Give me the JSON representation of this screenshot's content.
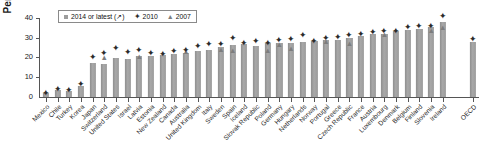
{
  "chart_data": {
    "type": "bar",
    "title": "",
    "xlabel": "",
    "ylabel": "Per cent",
    "ylim": [
      0,
      45
    ],
    "yticks": [
      0,
      10,
      20,
      30,
      40
    ],
    "grid": false,
    "legend_position": "top-left",
    "categories": [
      "Mexico",
      "Chile",
      "Turkey",
      "Korea",
      "Japan",
      "Switzerland",
      "United States",
      "Israel",
      "Latvia",
      "Estonia",
      "New Zealand",
      "Canada",
      "Australia",
      "United Kingdom",
      "Italy",
      "Sweden",
      "Spain",
      "Iceland",
      "Slovak Republic",
      "Poland",
      "Germany",
      "Hungary",
      "Netherlands",
      "Norway",
      "Portugal",
      "Greece",
      "Czech Republic",
      "France",
      "Austria",
      "Luxembourg",
      "Denmark",
      "Belgium",
      "Finland",
      "Slovenia",
      "Ireland",
      "OECD"
    ],
    "series": [
      {
        "name": "2014 or latest (↗)",
        "marker": "bar",
        "color": "#9d9d9d",
        "values": [
          2.0,
          3.5,
          3.2,
          5.5,
          17.0,
          16.5,
          19.5,
          19.0,
          20.5,
          20.5,
          21.0,
          22.0,
          22.5,
          23.5,
          24.0,
          25.5,
          26.5,
          27.0,
          26.0,
          27.5,
          27.5,
          27.5,
          28.0,
          28.5,
          29.0,
          29.0,
          30.0,
          31.0,
          32.0,
          32.0,
          33.5,
          34.0,
          34.5,
          35.5,
          38.0,
          28.0
        ]
      },
      {
        "name": "2010",
        "marker": "diamond",
        "color": "#2b2b2b",
        "values": [
          2.2,
          4.0,
          3.5,
          6.5,
          20.0,
          22.5,
          25.0,
          23.0,
          24.0,
          22.0,
          21.5,
          23.5,
          24.0,
          26.0,
          27.0,
          27.0,
          30.0,
          27.5,
          28.5,
          27.5,
          29.0,
          29.5,
          31.5,
          28.5,
          30.0,
          30.5,
          31.5,
          32.0,
          33.0,
          33.5,
          33.5,
          35.5,
          36.0,
          36.0,
          41.0,
          29.5
        ]
      },
      {
        "name": "2007",
        "marker": "triangle",
        "color": "#7d7d7d",
        "values": [
          null,
          null,
          null,
          null,
          null,
          19.5,
          null,
          null,
          20.0,
          null,
          null,
          null,
          23.0,
          null,
          null,
          24.0,
          23.5,
          null,
          null,
          23.5,
          26.5,
          24.5,
          null,
          null,
          28.0,
          null,
          27.0,
          null,
          null,
          31.5,
          null,
          null,
          null,
          33.5,
          35.0,
          null
        ]
      }
    ]
  },
  "legend": {
    "entries": [
      {
        "label": "2014 or latest (↗)",
        "marker": "bar-swatch"
      },
      {
        "label": "2010",
        "marker": "diamond-marker"
      },
      {
        "label": "2007",
        "marker": "triangle-marker"
      }
    ]
  },
  "axis": {
    "y_title": "Per cent",
    "y_tick_labels": [
      "0",
      "10",
      "20",
      "30",
      "40"
    ]
  }
}
